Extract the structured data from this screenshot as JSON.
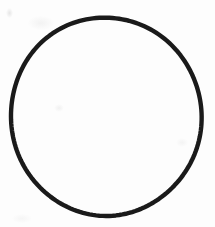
{
  "canvas": {
    "width": 215,
    "height": 227,
    "background_color": "#fdfdfd"
  },
  "figure": {
    "name": "circle-outline",
    "shape": "circle",
    "stroke_color": "#1a1a1a",
    "fill_color": "none",
    "stroke_width": 4.4,
    "center_x": 106,
    "center_y": 116.5,
    "radius_x": 95,
    "radius_y": 99.5,
    "bounds": {
      "left": 11,
      "top": 17,
      "right": 201,
      "bottom": 216
    }
  },
  "artifacts": {
    "smudges_visible": true,
    "smudge_color": "#aaaaaa"
  }
}
